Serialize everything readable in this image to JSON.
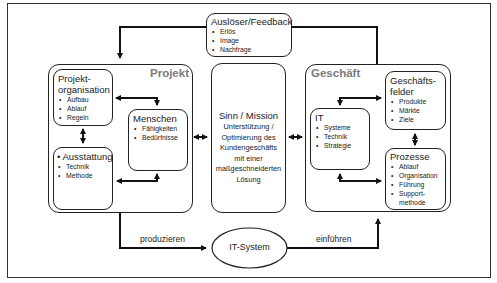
{
  "feedback": {
    "title": "Auslöser/Feedback",
    "items": [
      "Erlös",
      "Image",
      "Nachfrage"
    ]
  },
  "projekt": {
    "title": "Projekt",
    "projektorganisation": {
      "title_line1": "Projekt-",
      "title_line2": "organisation",
      "items": [
        "Aufbau",
        "Ablauf",
        "Regeln"
      ]
    },
    "menschen": {
      "title": "Menschen",
      "items": [
        "Fähigkeiten",
        "Bedürfnisse"
      ]
    },
    "ausstattung": {
      "title": "• Ausstattung",
      "items": [
        "Technik",
        "Methode"
      ]
    }
  },
  "sinn": {
    "title": "Sinn / Mission",
    "lines": [
      "Unterstützung /",
      "Optimierung des",
      "Kundengeschäfts",
      "mit einer",
      "maßgeschneiderten",
      "Lösung"
    ]
  },
  "geschaeft": {
    "title": "Geschäft",
    "geschaeftsfelder": {
      "title_line1": "Geschäfts-",
      "title_line2": "felder",
      "items": [
        "Produkte",
        "Märkte",
        "Ziele"
      ]
    },
    "it": {
      "title": "IT",
      "items": [
        "Systeme",
        "Technik",
        "Strategie"
      ]
    },
    "prozesse": {
      "title": "Prozesse",
      "items": [
        "Ablauf",
        "Organisation",
        "Führung",
        "Support-"
      ],
      "continuation": "methode"
    }
  },
  "it_system": {
    "label": "IT-System"
  },
  "edges": {
    "produzieren": "produzieren",
    "einfuehren": "einführen"
  },
  "colors": {
    "line": "#111111",
    "group_title": "#7a7a7a",
    "border": "#222222"
  }
}
